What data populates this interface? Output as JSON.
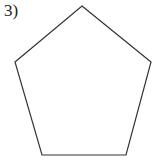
{
  "problem": {
    "number_label": "3)"
  },
  "figure": {
    "shape": "regular pentagon",
    "stroke_color": "#333333",
    "points": "82,6 151,62 126,155 42,155 15,62"
  }
}
